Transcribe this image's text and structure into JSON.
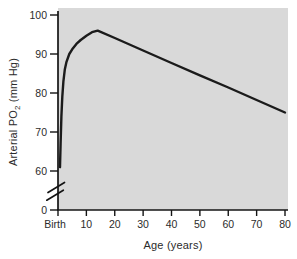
{
  "figure": {
    "y_axis_title": {
      "pre": "Arterial PO",
      "sub": "2",
      "post": " (mm Hg)"
    },
    "x_axis_title": "Age (years)"
  },
  "chart_data": {
    "type": "line",
    "title": "",
    "xlabel": "Age (years)",
    "ylabel": "Arterial PO2 (mm Hg)",
    "x_ticks": [
      "Birth",
      "10",
      "20",
      "30",
      "40",
      "50",
      "60",
      "70",
      "80"
    ],
    "x_tick_values": [
      0,
      10,
      20,
      30,
      40,
      50,
      60,
      70,
      80
    ],
    "y_ticks": [
      "100",
      "90",
      "80",
      "70",
      "60",
      "0"
    ],
    "y_axis_break": true,
    "xlim": [
      0,
      80
    ],
    "ylim_shown": [
      60,
      100
    ],
    "grid": false,
    "legend": false,
    "colors": {
      "plot_bg": "#d9d9d9",
      "line": "#1b1b1b",
      "axis": "#141414",
      "text": "#2b2b2b"
    },
    "series": [
      {
        "name": "Arterial PO2 vs Age",
        "points": [
          [
            0.7,
            61
          ],
          [
            0.9,
            67
          ],
          [
            1.2,
            74
          ],
          [
            1.5,
            79
          ],
          [
            1.9,
            83
          ],
          [
            2.4,
            86
          ],
          [
            3,
            88
          ],
          [
            4,
            90
          ],
          [
            5,
            91.2
          ],
          [
            6.5,
            92.6
          ],
          [
            8,
            93.6
          ],
          [
            10,
            94.7
          ],
          [
            12,
            95.6
          ],
          [
            14,
            96
          ],
          [
            20,
            94.1
          ],
          [
            30,
            90.9
          ],
          [
            40,
            87.7
          ],
          [
            50,
            84.5
          ],
          [
            60,
            81.4
          ],
          [
            70,
            78.2
          ],
          [
            80,
            75
          ]
        ]
      }
    ]
  }
}
